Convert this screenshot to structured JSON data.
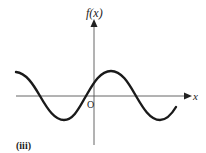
{
  "figure": {
    "label": "(iii)",
    "y_axis_label": "f(x)",
    "x_axis_label": "x",
    "origin_label": "O",
    "curve_type": "sinusoidal wave",
    "colors": {
      "curve": "#1a1a1a",
      "axes": "#555555",
      "text": "#222222"
    }
  }
}
